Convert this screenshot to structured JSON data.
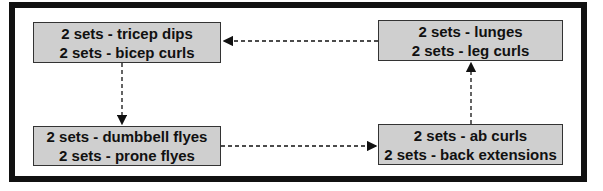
{
  "diagram": {
    "type": "flow-cycle",
    "nodes": [
      {
        "id": "top-left",
        "lines": [
          "2 sets - tricep dips",
          "2 sets - bicep curls"
        ]
      },
      {
        "id": "top-right",
        "lines": [
          "2 sets - lunges",
          "2 sets - leg curls"
        ]
      },
      {
        "id": "bottom-left",
        "lines": [
          "2 sets - dumbbell flyes",
          "2 sets - prone flyes"
        ]
      },
      {
        "id": "bottom-right",
        "lines": [
          "2 sets - ab curls",
          "2 sets - back extensions"
        ]
      }
    ],
    "edges": [
      {
        "from": "top-right",
        "to": "top-left",
        "style": "dashed"
      },
      {
        "from": "top-left",
        "to": "bottom-left",
        "style": "dashed"
      },
      {
        "from": "bottom-left",
        "to": "bottom-right",
        "style": "dashed"
      },
      {
        "from": "bottom-right",
        "to": "top-right",
        "style": "dashed"
      }
    ],
    "colors": {
      "box_fill": "#cfcfcf",
      "border": "#111111",
      "background": "#ffffff"
    }
  }
}
